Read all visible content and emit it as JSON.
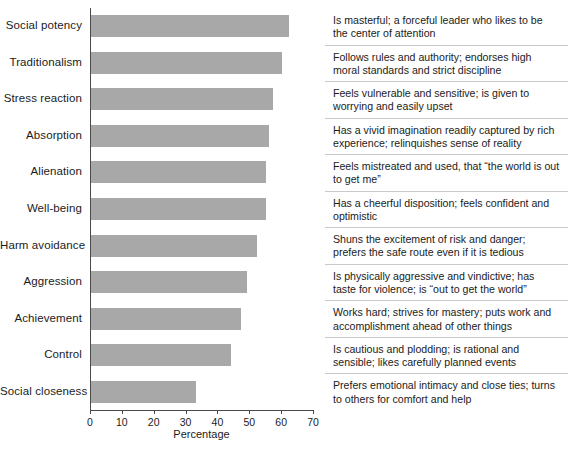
{
  "chart_data": {
    "type": "bar",
    "orientation": "horizontal",
    "title": "",
    "subtitle": "",
    "xlabel": "Percentage",
    "ylabel": "",
    "xlim": [
      0,
      70
    ],
    "xticks": [
      0,
      10,
      20,
      30,
      40,
      50,
      60,
      70
    ],
    "grid": false,
    "legend": null,
    "bar_color": "#a8a8a8",
    "axis_color": "#4a4a4a",
    "rule_color": "#c9c9c9",
    "categories": [
      "Social potency",
      "Traditionalism",
      "Stress reaction",
      "Absorption",
      "Alienation",
      "Well-being",
      "Harm avoidance",
      "Aggression",
      "Achievement",
      "Control",
      "Social closeness"
    ],
    "values": [
      62,
      60,
      57,
      56,
      55,
      55,
      52,
      49,
      47,
      44,
      33
    ],
    "annotations": [
      "Is masterful; a forceful leader who likes to be the center of attention",
      "Follows rules and authority; endorses high moral standards and strict discipline",
      "Feels vulnerable and sensitive; is given to worrying and easily upset",
      "Has a vivid imagination readily captured by rich experience; relinquishes sense of reality",
      "Feels mistreated and used, that “the world is out to get me”",
      "Has a cheerful disposition; feels confident and optimistic",
      "Shuns the excitement of risk and danger; prefers the safe route even if it is tedious",
      "Is physically aggressive and vindictive; has taste for violence; is “out to get the world”",
      "Works hard; strives for mastery; puts work and accomplishment ahead of other things",
      "Is cautious and plodding; is rational and sensible; likes carefully planned events",
      "Prefers emotional intimacy and close ties; turns to others for comfort and help"
    ]
  },
  "axis": {
    "tick_labels": [
      "0",
      "10",
      "20",
      "30",
      "40",
      "50",
      "60",
      "70"
    ],
    "x_title": "Percentage"
  }
}
